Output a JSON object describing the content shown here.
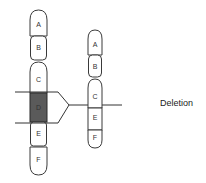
{
  "diagram": {
    "caption": "Deletion",
    "original_chromosome": {
      "segments": [
        {
          "label": "A",
          "highlighted": false
        },
        {
          "label": "B",
          "highlighted": false
        },
        {
          "label": "C",
          "highlighted": false
        },
        {
          "label": "D",
          "highlighted": true
        },
        {
          "label": "E",
          "highlighted": false
        },
        {
          "label": "F",
          "highlighted": false
        }
      ]
    },
    "result_chromosome": {
      "segments": [
        {
          "label": "A"
        },
        {
          "label": "B"
        },
        {
          "label": "C"
        },
        {
          "label": "E"
        },
        {
          "label": "F"
        }
      ]
    },
    "colors": {
      "deleted_segment": "#5a5a5a",
      "segment_fill": "#ffffff",
      "outline": "#3a3a3a"
    }
  }
}
